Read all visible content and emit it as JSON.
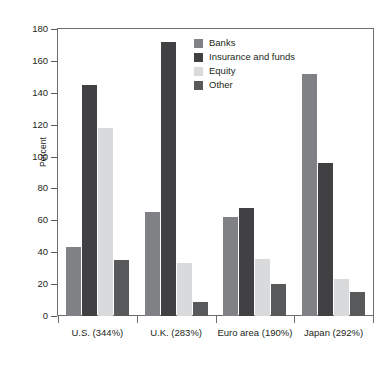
{
  "chart_data": {
    "type": "bar",
    "title": "",
    "subtitle": "",
    "xlabel": "",
    "ylabel": "Percent",
    "ylim": [
      0,
      180
    ],
    "ytick_step": 20,
    "yticks": [
      180,
      160,
      140,
      120,
      100,
      80,
      60,
      40,
      20,
      0
    ],
    "grid": false,
    "legend_position": "inside-top-center",
    "categories": [
      "U.S. (344%)",
      "U.K. (283%)",
      "Euro area (190%)",
      "Japan (292%)"
    ],
    "series": [
      {
        "name": "Banks",
        "color": "#808184",
        "values": [
          43,
          65,
          62,
          152
        ]
      },
      {
        "name": "Insurance and funds",
        "color": "#414042",
        "values": [
          145,
          172,
          68,
          96
        ]
      },
      {
        "name": "Equity",
        "color": "#d9dadb",
        "values": [
          118,
          33,
          36,
          23
        ]
      },
      {
        "name": "Other",
        "color": "#58595b",
        "values": [
          35,
          9,
          20,
          15
        ]
      }
    ]
  },
  "axes": {
    "y_title": "Percent",
    "y_tick_labels": [
      "180",
      "160",
      "140",
      "120",
      "100",
      "80",
      "60",
      "40",
      "20",
      "0"
    ],
    "x_tick_labels": [
      "U.S. (344%)",
      "U.K. (283%)",
      "Euro area (190%)",
      "Japan (292%)"
    ]
  },
  "legend": {
    "items": [
      {
        "label": "Banks",
        "color": "#808184"
      },
      {
        "label": "Insurance and funds",
        "color": "#414042"
      },
      {
        "label": "Equity",
        "color": "#d9dadb"
      },
      {
        "label": "Other",
        "color": "#58595b"
      }
    ]
  },
  "colors": {
    "banks": "#808184",
    "insurance_and_funds": "#414042",
    "equity": "#d9dadb",
    "other": "#58595b",
    "axis": "#6d6e71",
    "text": "#231f20",
    "background": "#ffffff"
  }
}
